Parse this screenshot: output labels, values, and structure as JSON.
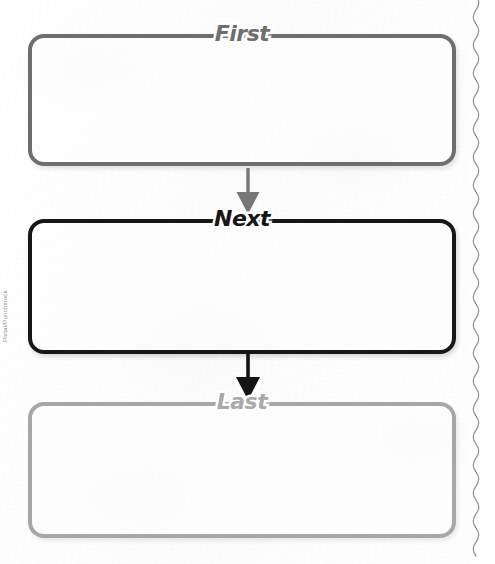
{
  "document": {
    "type": "graphic-organizer",
    "title": "Sequence chart: First / Next / Last",
    "credit": "Pixtal/Punchstock"
  },
  "flow": {
    "boxes": [
      {
        "id": "first",
        "label": "First",
        "content": "",
        "border_color": "#6e6e6e",
        "label_color": "#6e6e6e",
        "x": 28,
        "y": 34,
        "width": 428,
        "height": 132
      },
      {
        "id": "next",
        "label": "Next",
        "content": "",
        "border_color": "#171717",
        "label_color": "#161616",
        "x": 28,
        "y": 219,
        "width": 428,
        "height": 135
      },
      {
        "id": "last",
        "label": "Last",
        "content": "",
        "border_color": "#a7a7a7",
        "label_color": "#a9a9a9",
        "x": 28,
        "y": 402,
        "width": 428,
        "height": 136
      }
    ],
    "arrows": [
      {
        "id": "arrow-first-to-next",
        "color": "#777777",
        "from": "first",
        "to": "next"
      },
      {
        "id": "arrow-next-to-last",
        "color": "#141414",
        "from": "next",
        "to": "last"
      }
    ]
  },
  "page_edge": {
    "style": "perforated-wave",
    "color": "#9a9a9a"
  },
  "colors": {
    "paper": "#fdfdfd",
    "gray_mid": "#6e6e6e",
    "black": "#171717",
    "gray_light": "#a7a7a7"
  }
}
